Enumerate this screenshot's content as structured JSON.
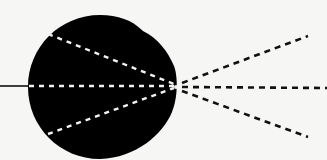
{
  "diagram": {
    "type": "eye-optics",
    "colors": {
      "background": "#f6f6f4",
      "eye": "#000000",
      "inner_rays": "#f2f2ee",
      "outer_rays": "#111111",
      "axis_line": "#111111"
    },
    "eye": {
      "center": [
        100,
        87
      ],
      "radius": 72,
      "cornea_bulge": true
    },
    "focal_point": [
      176,
      87
    ],
    "axis_line": {
      "from": [
        0,
        86
      ],
      "to": [
        28,
        86
      ]
    },
    "inner_rays": [
      {
        "from": [
          48,
          34
        ],
        "to": [
          174,
          84
        ]
      },
      {
        "from": [
          29,
          86
        ],
        "to": [
          174,
          86
        ]
      },
      {
        "from": [
          48,
          134
        ],
        "to": [
          174,
          88
        ]
      }
    ],
    "outer_rays": [
      {
        "from": [
          180,
          84
        ],
        "to": [
          308,
          36
        ]
      },
      {
        "from": [
          180,
          87
        ],
        "to": [
          327,
          88
        ]
      },
      {
        "from": [
          180,
          90
        ],
        "to": [
          308,
          137
        ]
      }
    ]
  }
}
